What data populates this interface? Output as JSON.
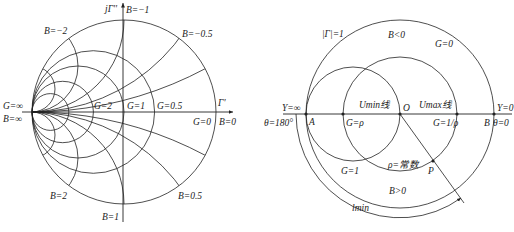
{
  "left_chart": {
    "title": "Admittance Smith chart",
    "axis_labels": {
      "imag": "jΓ''",
      "real": "Γ'"
    },
    "conductance_labels": [
      {
        "label": "G=∞",
        "value": "∞"
      },
      {
        "label": "G=2",
        "value": 2
      },
      {
        "label": "G=1",
        "value": 1
      },
      {
        "label": "G=0.5",
        "value": 0.5
      },
      {
        "label": "G=0",
        "value": 0
      }
    ],
    "susceptance_labels": [
      {
        "label": "B=−2",
        "value": -2
      },
      {
        "label": "B=−1",
        "value": -1
      },
      {
        "label": "B=−0.5",
        "value": -0.5
      },
      {
        "label": "B=∞",
        "value": "∞"
      },
      {
        "label": "B=0",
        "value": 0
      },
      {
        "label": "B=2",
        "value": 2
      },
      {
        "label": "B=1",
        "value": 1
      },
      {
        "label": "B=0.5",
        "value": 0.5
      }
    ]
  },
  "right_chart": {
    "labels": {
      "gamma_unit": "|Γ|=1",
      "b_negative": "B<0",
      "g_zero": "G=0",
      "y_infinite": "Y=∞",
      "theta_180": "θ=180°",
      "point_a": "A",
      "g_rho": "G=ρ",
      "u_min_line": "Umin线",
      "origin": "O",
      "u_max_line": "Umax线",
      "g_inv_rho": "G=1/ρ",
      "y_zero": "Y=0",
      "point_b": "B",
      "theta_0": "θ=0",
      "g_one": "G=1",
      "rho_const": "ρ=常数",
      "point_p": "P",
      "b_positive": "B>0",
      "l_min": "lmin"
    }
  },
  "colors": {
    "line": "#222222",
    "background": "#ffffff"
  }
}
